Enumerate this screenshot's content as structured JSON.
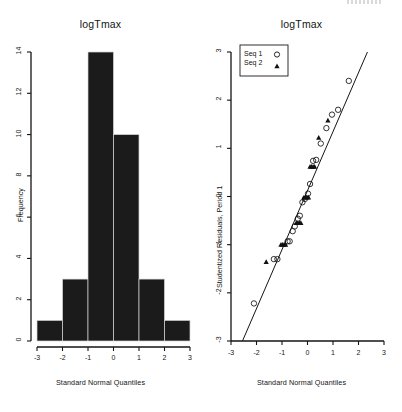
{
  "figure": {
    "background": "#ffffff",
    "ink": "#141414",
    "bar_fill": "#1b1b1b"
  },
  "panels": [
    {
      "id": "histogram",
      "title": "logTmax",
      "xlabel": "Standard Normal Quantiles",
      "ylabel": "Frequency"
    },
    {
      "id": "qqplot",
      "title": "logTmax",
      "xlabel": "Standard Normal Quantiles",
      "ylabel": "Studentized Residuals, Period 1"
    }
  ],
  "legend": {
    "items": [
      {
        "label": "Seq 1",
        "marker": "circle-marker"
      },
      {
        "label": "Seq 2",
        "marker": "triangle-marker"
      }
    ]
  },
  "chart_data": [
    {
      "type": "bar",
      "id": "histogram",
      "title": "logTmax",
      "xlabel": "Standard Normal Quantiles",
      "ylabel": "Frequency",
      "grid": false,
      "legend": "none",
      "xlim": [
        -3,
        3
      ],
      "ylim": [
        0,
        14
      ],
      "xticks": [
        -3,
        -2,
        -1,
        0,
        1,
        2,
        3
      ],
      "yticks": [
        0,
        2,
        4,
        6,
        8,
        10,
        12,
        14
      ],
      "bin_edges": [
        -3,
        -2,
        -1,
        0,
        1,
        2,
        3
      ],
      "categories": [
        "-3 to -2",
        "-2 to -1",
        "-1 to 0",
        "0 to 1",
        "1 to 2",
        "2 to 3"
      ],
      "values": [
        1,
        3,
        14,
        10,
        3,
        1
      ]
    },
    {
      "type": "scatter",
      "id": "qqplot",
      "title": "logTmax",
      "xlabel": "Standard Normal Quantiles",
      "ylabel": "Studentized Residuals, Period 1",
      "grid": false,
      "legend": "top-left",
      "xlim": [
        -3,
        3
      ],
      "ylim": [
        -3,
        3
      ],
      "xticks": [
        -3,
        -2,
        -1,
        0,
        1,
        2,
        3
      ],
      "yticks": [
        -3,
        -2,
        -1,
        0,
        1,
        2,
        3
      ],
      "reference_line": {
        "x": [
          -2.55,
          2.35
        ],
        "y": [
          -3.0,
          3.0
        ]
      },
      "series": [
        {
          "name": "Seq 1",
          "marker": "circle-marker",
          "points": [
            [
              -2.1,
              -2.22
            ],
            [
              -1.32,
              -1.3
            ],
            [
              -1.18,
              -1.3
            ],
            [
              -0.78,
              -0.93
            ],
            [
              -0.7,
              -0.93
            ],
            [
              -0.58,
              -0.72
            ],
            [
              -0.5,
              -0.62
            ],
            [
              -0.38,
              -0.46
            ],
            [
              -0.3,
              -0.4
            ],
            [
              -0.2,
              -0.12
            ],
            [
              -0.1,
              -0.05
            ],
            [
              0.02,
              0.06
            ],
            [
              0.1,
              0.26
            ],
            [
              0.22,
              0.74
            ],
            [
              0.34,
              0.76
            ],
            [
              0.52,
              1.1
            ],
            [
              0.74,
              1.42
            ],
            [
              0.96,
              1.7
            ],
            [
              1.2,
              1.8
            ],
            [
              1.62,
              2.4
            ]
          ]
        },
        {
          "name": "Seq 2",
          "marker": "triangle-marker",
          "points": [
            [
              -1.62,
              -1.36
            ],
            [
              -1.04,
              -1.0
            ],
            [
              -0.98,
              -1.0
            ],
            [
              -0.92,
              -1.0
            ],
            [
              -0.86,
              -1.0
            ],
            [
              -0.44,
              -0.55
            ],
            [
              -0.38,
              -0.55
            ],
            [
              -0.32,
              -0.55
            ],
            [
              -0.26,
              -0.55
            ],
            [
              -0.14,
              -0.02
            ],
            [
              -0.08,
              -0.02
            ],
            [
              -0.02,
              -0.02
            ],
            [
              0.04,
              -0.02
            ],
            [
              0.1,
              0.62
            ],
            [
              0.16,
              0.62
            ],
            [
              0.22,
              0.62
            ],
            [
              0.28,
              0.62
            ],
            [
              0.44,
              1.22
            ],
            [
              0.8,
              1.58
            ]
          ]
        }
      ]
    }
  ]
}
